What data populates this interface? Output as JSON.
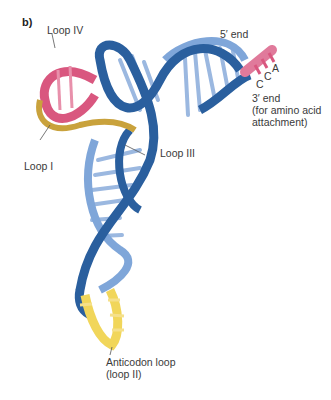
{
  "panel_label": "b)",
  "labels": {
    "loop_iv": "Loop IV",
    "loop_i": "Loop I",
    "loop_iii": "Loop III",
    "five_prime": "5′ end",
    "three_prime": "3′ end",
    "three_prime_note1": "(for amino acid",
    "three_prime_note2": "attachment)",
    "base_a": "A",
    "base_c1": "C",
    "base_c2": "C",
    "anticodon1": "Anticodon loop",
    "anticodon2": "(loop II)"
  },
  "colors": {
    "dark_blue": "#2a5f9e",
    "light_blue": "#7fa6d9",
    "pink": "#d9577f",
    "light_pink": "#e890ab",
    "gold": "#c9a23c",
    "yellow": "#f1d65a"
  }
}
